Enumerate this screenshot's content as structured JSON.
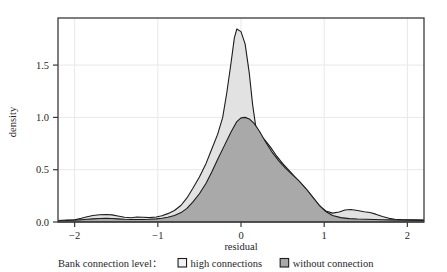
{
  "chart_data": {
    "type": "area",
    "title": "",
    "xlabel": "residual",
    "ylabel": "density",
    "xlim": [
      -2.2,
      2.2
    ],
    "ylim": [
      0,
      1.95
    ],
    "grid": true,
    "legend_position": "bottom",
    "legend_title": "Bank connection level：",
    "xticks": [
      -2,
      -1,
      0,
      1,
      2
    ],
    "xtick_labels": [
      "−2",
      "−1",
      "0",
      "1",
      "2"
    ],
    "yticks": [
      0.0,
      0.5,
      1.0,
      1.5
    ],
    "ytick_labels": [
      "0.0",
      "0.5",
      "1.0",
      "1.5"
    ],
    "series": [
      {
        "name": "high connections",
        "fill": "#e2e2e2",
        "stroke": "#1c1c1c",
        "x": [
          -2.2,
          -2.1,
          -2.0,
          -1.92,
          -1.85,
          -1.78,
          -1.7,
          -1.62,
          -1.55,
          -1.48,
          -1.4,
          -1.32,
          -1.25,
          -1.18,
          -1.1,
          -1.02,
          -0.95,
          -0.88,
          -0.8,
          -0.72,
          -0.65,
          -0.58,
          -0.5,
          -0.42,
          -0.35,
          -0.28,
          -0.22,
          -0.17,
          -0.12,
          -0.08,
          -0.05,
          0.0,
          0.05,
          0.1,
          0.14,
          0.18,
          0.22,
          0.28,
          0.35,
          0.42,
          0.5,
          0.58,
          0.65,
          0.72,
          0.8,
          0.88,
          0.95,
          1.02,
          1.1,
          1.18,
          1.25,
          1.32,
          1.4,
          1.48,
          1.55,
          1.62,
          1.7,
          1.78,
          1.85,
          1.95,
          2.05,
          2.2
        ],
        "y": [
          0.015,
          0.018,
          0.022,
          0.035,
          0.05,
          0.062,
          0.07,
          0.072,
          0.068,
          0.058,
          0.045,
          0.04,
          0.048,
          0.045,
          0.042,
          0.048,
          0.06,
          0.08,
          0.11,
          0.16,
          0.23,
          0.32,
          0.43,
          0.56,
          0.7,
          0.84,
          1.0,
          1.24,
          1.52,
          1.76,
          1.845,
          1.82,
          1.7,
          1.42,
          1.12,
          0.9,
          0.83,
          0.79,
          0.72,
          0.64,
          0.56,
          0.49,
          0.43,
          0.37,
          0.3,
          0.22,
          0.15,
          0.105,
          0.085,
          0.095,
          0.115,
          0.12,
          0.11,
          0.098,
          0.09,
          0.075,
          0.052,
          0.035,
          0.026,
          0.022,
          0.02,
          0.018
        ]
      },
      {
        "name": "without connection",
        "fill": "#a9a9a9",
        "stroke": "#1c1c1c",
        "x": [
          -2.2,
          -2.1,
          -2.0,
          -1.92,
          -1.85,
          -1.78,
          -1.7,
          -1.62,
          -1.55,
          -1.48,
          -1.4,
          -1.32,
          -1.25,
          -1.18,
          -1.1,
          -1.02,
          -0.95,
          -0.88,
          -0.8,
          -0.72,
          -0.65,
          -0.58,
          -0.5,
          -0.42,
          -0.35,
          -0.28,
          -0.2,
          -0.12,
          -0.05,
          0.0,
          0.05,
          0.1,
          0.16,
          0.22,
          0.3,
          0.38,
          0.46,
          0.54,
          0.62,
          0.7,
          0.78,
          0.86,
          0.94,
          1.02,
          1.1,
          1.2,
          1.3,
          1.4,
          1.5,
          1.6,
          1.7,
          1.8,
          1.95,
          2.2
        ],
        "y": [
          0.012,
          0.014,
          0.018,
          0.022,
          0.026,
          0.03,
          0.034,
          0.036,
          0.034,
          0.03,
          0.026,
          0.024,
          0.024,
          0.024,
          0.026,
          0.03,
          0.036,
          0.046,
          0.062,
          0.09,
          0.13,
          0.19,
          0.27,
          0.37,
          0.48,
          0.6,
          0.73,
          0.86,
          0.96,
          0.995,
          1.0,
          0.985,
          0.94,
          0.87,
          0.76,
          0.66,
          0.58,
          0.51,
          0.45,
          0.39,
          0.32,
          0.24,
          0.16,
          0.1,
          0.062,
          0.042,
          0.032,
          0.028,
          0.026,
          0.024,
          0.022,
          0.02,
          0.018,
          0.016
        ]
      }
    ]
  },
  "legend": {
    "title": "Bank connection level：",
    "items": [
      {
        "label": "high connections",
        "swatch": "#f2f2f2",
        "swatch_border": "#1c1c1c"
      },
      {
        "label": "without connection",
        "swatch": "#a9a9a9",
        "swatch_border": "#1c1c1c"
      }
    ]
  },
  "colors": {
    "frame": "#3a3a3a",
    "grid": "#e8e8ec",
    "text": "#26262a",
    "background": "#ffffff"
  }
}
